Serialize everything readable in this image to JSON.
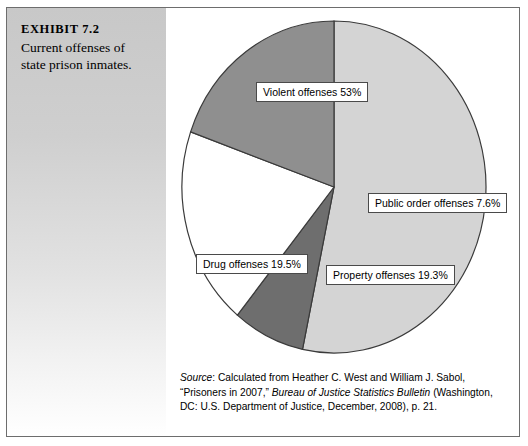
{
  "exhibit": {
    "title": "EXHIBIT 7.2",
    "caption": "Current offenses of state prison inmates."
  },
  "source": {
    "prefix": "Source",
    "text_1": ": Calculated from Heather C. West and William J. Sabol, “Prisoners in 2007,” ",
    "italic_1": "Bureau of Justice Statistics Bulletin",
    "text_2": " (Washington, DC: U.S. Department of Justice, December, 2008), p. 21."
  },
  "labels": {
    "violent": "Violent offenses   53%",
    "public_order": "Public order offenses   7.6%",
    "property": "Property offenses   19.3%",
    "drug": "Drug offenses   19.5%"
  },
  "chart_data": {
    "type": "pie",
    "title": "Current offenses of state prison inmates.",
    "categories": [
      "Violent offenses",
      "Public order offenses",
      "Property offenses",
      "Drug offenses"
    ],
    "values": [
      53.0,
      7.6,
      19.3,
      19.5
    ],
    "unit": "percent",
    "labels": [
      "Violent offenses   53%",
      "Public order offenses   7.6%",
      "Property offenses   19.3%",
      "Drug offenses   19.5%"
    ],
    "colors": [
      "#d4d4d4",
      "#6e6e6e",
      "#ffffff",
      "#8f8f8f"
    ],
    "legend": "none",
    "start_angle_deg": -90,
    "direction": "clockwise"
  }
}
